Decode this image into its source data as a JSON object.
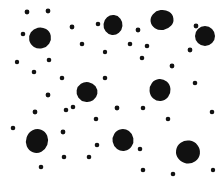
{
  "image": {
    "kind": "random-dot-pattern",
    "width": 218,
    "height": 180,
    "background_color": "#ffffff",
    "dot_color": "#111111",
    "large_dot_count": 9,
    "small_dot_count": 30,
    "total_dot_count": 39
  },
  "chart_data": {
    "type": "scatter",
    "title": "",
    "subtitle": "",
    "xlabel": "",
    "ylabel": "",
    "xlim": [
      0,
      218
    ],
    "ylim": [
      0,
      180
    ],
    "grid": false,
    "legend": null,
    "annotations": [],
    "xticks": [],
    "yticks": [],
    "series": [
      {
        "name": "large-dots",
        "color": "#111111",
        "marker": "circle",
        "points": [
          {
            "x": 40,
            "y": 38,
            "rx": 11.0,
            "ry": 10.5,
            "rot": -12
          },
          {
            "x": 113,
            "y": 25,
            "rx": 9.5,
            "ry": 10.0,
            "rot": 6
          },
          {
            "x": 162,
            "y": 20,
            "rx": 11.5,
            "ry": 10.0,
            "rot": -8
          },
          {
            "x": 87,
            "y": 92,
            "rx": 10.5,
            "ry": 10.0,
            "rot": 10
          },
          {
            "x": 160,
            "y": 90,
            "rx": 10.5,
            "ry": 11.0,
            "rot": -5
          },
          {
            "x": 37,
            "y": 141,
            "rx": 11.0,
            "ry": 12.0,
            "rot": 20
          },
          {
            "x": 123,
            "y": 140,
            "rx": 10.5,
            "ry": 11.0,
            "rot": -10
          },
          {
            "x": 188,
            "y": 152,
            "rx": 12.0,
            "ry": 11.5,
            "rot": 8
          },
          {
            "x": 205,
            "y": 36,
            "rx": 10.0,
            "ry": 10.0,
            "rot": 0
          }
        ]
      },
      {
        "name": "small-dots",
        "color": "#111111",
        "marker": "circle",
        "points": [
          {
            "x": 27,
            "y": 12,
            "r": 2.4
          },
          {
            "x": 48,
            "y": 11,
            "r": 2.4
          },
          {
            "x": 23,
            "y": 34,
            "r": 2.3
          },
          {
            "x": 72,
            "y": 27,
            "r": 2.4
          },
          {
            "x": 98,
            "y": 24,
            "r": 2.3
          },
          {
            "x": 82,
            "y": 44,
            "r": 2.3
          },
          {
            "x": 105,
            "y": 52,
            "r": 2.2
          },
          {
            "x": 138,
            "y": 30,
            "r": 2.4
          },
          {
            "x": 130,
            "y": 44,
            "r": 2.3
          },
          {
            "x": 147,
            "y": 46,
            "r": 2.3
          },
          {
            "x": 142,
            "y": 58,
            "r": 2.3
          },
          {
            "x": 172,
            "y": 66,
            "r": 2.4
          },
          {
            "x": 196,
            "y": 26,
            "r": 2.4
          },
          {
            "x": 190,
            "y": 50,
            "r": 2.4
          },
          {
            "x": 195,
            "y": 83,
            "r": 2.3
          },
          {
            "x": 49,
            "y": 60,
            "r": 2.3
          },
          {
            "x": 17,
            "y": 62,
            "r": 2.2
          },
          {
            "x": 34,
            "y": 72,
            "r": 2.3
          },
          {
            "x": 62,
            "y": 78,
            "r": 2.3
          },
          {
            "x": 48,
            "y": 95,
            "r": 2.4
          },
          {
            "x": 35,
            "y": 112,
            "r": 2.4
          },
          {
            "x": 13,
            "y": 128,
            "r": 2.3
          },
          {
            "x": 66,
            "y": 110,
            "r": 2.3
          },
          {
            "x": 63,
            "y": 132,
            "r": 2.4
          },
          {
            "x": 64,
            "y": 157,
            "r": 2.3
          },
          {
            "x": 41,
            "y": 167,
            "r": 2.3
          },
          {
            "x": 73,
            "y": 107,
            "r": 2.3
          },
          {
            "x": 117,
            "y": 108,
            "r": 2.4
          },
          {
            "x": 143,
            "y": 108,
            "r": 2.3
          },
          {
            "x": 96,
            "y": 119,
            "r": 2.3
          },
          {
            "x": 97,
            "y": 145,
            "r": 2.3
          },
          {
            "x": 89,
            "y": 157,
            "r": 2.3
          },
          {
            "x": 140,
            "y": 149,
            "r": 2.3
          },
          {
            "x": 143,
            "y": 170,
            "r": 2.3
          },
          {
            "x": 168,
            "y": 119,
            "r": 2.3
          },
          {
            "x": 212,
            "y": 112,
            "r": 2.3
          },
          {
            "x": 173,
            "y": 174,
            "r": 2.3
          },
          {
            "x": 213,
            "y": 170,
            "r": 2.2
          },
          {
            "x": 105,
            "y": 78,
            "r": 2.3
          }
        ]
      }
    ]
  }
}
